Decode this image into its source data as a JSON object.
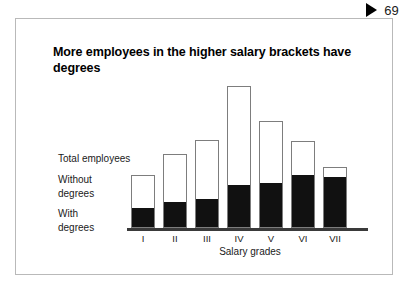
{
  "page_marker": {
    "icon": "play-triangle-icon",
    "number": "69"
  },
  "figure": {
    "title": "More employees in the higher salary brackets have degrees",
    "series_labels": {
      "total": "Total employees",
      "without": "Without\ndegrees",
      "with": "With\ndegrees"
    }
  },
  "chart_data": {
    "type": "bar",
    "subtype": "stacked",
    "title": "More employees in the higher salary brackets have degrees",
    "xlabel": "Salary grades",
    "ylabel": "",
    "grid": false,
    "legend_position": "left-annotations",
    "axis_visible": {
      "x": true,
      "y": false
    },
    "categories": [
      "I",
      "II",
      "III",
      "IV",
      "V",
      "VI",
      "VII"
    ],
    "series": [
      {
        "name": "With degrees",
        "color": "#111111",
        "values": [
          20,
          27,
          30,
          44,
          47,
          55,
          53
        ]
      },
      {
        "name": "Without degrees",
        "color": "#ffffff",
        "values": [
          36,
          51,
          63,
          106,
          66,
          37,
          12
        ]
      }
    ],
    "totals": {
      "name": "Total employees",
      "values": [
        56,
        78,
        93,
        150,
        113,
        92,
        65
      ]
    },
    "ylim": [
      0,
      160
    ]
  }
}
